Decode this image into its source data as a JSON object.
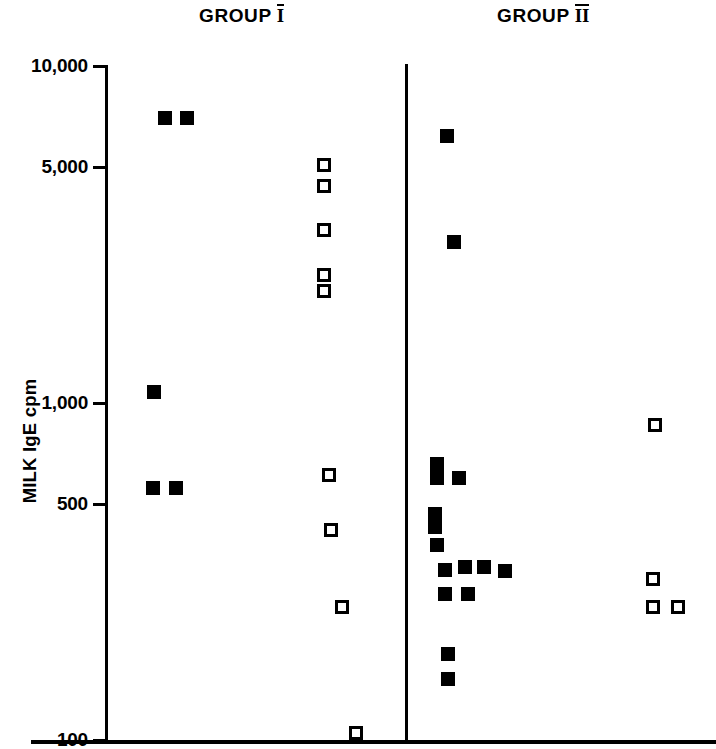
{
  "chart_data": {
    "type": "scatter",
    "title": "",
    "xlabel": "",
    "ylabel": "MILK IgE cpm",
    "yscale": "log",
    "ylim": [
      100,
      10000
    ],
    "ytick_labels": [
      "10,000",
      "5,000",
      "1,000",
      "500",
      "100"
    ],
    "ytick_values": [
      10000,
      5000,
      1000,
      500,
      100
    ],
    "grid": false,
    "legend": "none",
    "categories": [
      "GROUP I",
      "GROUP II"
    ],
    "series": [
      {
        "name": "filled-square",
        "marker": "filled square",
        "color": "#000000",
        "points": [
          {
            "group": "GROUP I",
            "x_px": 165,
            "value": 7000
          },
          {
            "group": "GROUP I",
            "x_px": 187,
            "value": 7000
          },
          {
            "group": "GROUP I",
            "x_px": 154,
            "value": 1080
          },
          {
            "group": "GROUP I",
            "x_px": 153,
            "value": 560
          },
          {
            "group": "GROUP I",
            "x_px": 176,
            "value": 560
          },
          {
            "group": "GROUP II",
            "x_px": 447,
            "value": 6200
          },
          {
            "group": "GROUP II",
            "x_px": 454,
            "value": 3000
          },
          {
            "group": "GROUP II",
            "x_px": 437,
            "value": 660
          },
          {
            "group": "GROUP II",
            "x_px": 437,
            "value": 600
          },
          {
            "group": "GROUP II",
            "x_px": 459,
            "value": 600
          },
          {
            "group": "GROUP II",
            "x_px": 435,
            "value": 470
          },
          {
            "group": "GROUP II",
            "x_px": 435,
            "value": 430
          },
          {
            "group": "GROUP II",
            "x_px": 437,
            "value": 380
          },
          {
            "group": "GROUP II",
            "x_px": 445,
            "value": 320
          },
          {
            "group": "GROUP II",
            "x_px": 465,
            "value": 325
          },
          {
            "group": "GROUP II",
            "x_px": 484,
            "value": 325
          },
          {
            "group": "GROUP II",
            "x_px": 505,
            "value": 318
          },
          {
            "group": "GROUP II",
            "x_px": 445,
            "value": 272
          },
          {
            "group": "GROUP II",
            "x_px": 468,
            "value": 272
          },
          {
            "group": "GROUP II",
            "x_px": 448,
            "value": 180
          },
          {
            "group": "GROUP II",
            "x_px": 448,
            "value": 152
          }
        ]
      },
      {
        "name": "open-square",
        "marker": "open square",
        "color": "#ffffff",
        "points": [
          {
            "group": "GROUP I",
            "x_px": 324,
            "value": 5100
          },
          {
            "group": "GROUP I",
            "x_px": 324,
            "value": 4400
          },
          {
            "group": "GROUP I",
            "x_px": 324,
            "value": 3250
          },
          {
            "group": "GROUP I",
            "x_px": 324,
            "value": 2400
          },
          {
            "group": "GROUP I",
            "x_px": 324,
            "value": 2150
          },
          {
            "group": "GROUP I",
            "x_px": 329,
            "value": 610
          },
          {
            "group": "GROUP I",
            "x_px": 331,
            "value": 420
          },
          {
            "group": "GROUP I",
            "x_px": 342,
            "value": 248
          },
          {
            "group": "GROUP I",
            "x_px": 356,
            "value": 105
          },
          {
            "group": "GROUP II",
            "x_px": 655,
            "value": 860
          },
          {
            "group": "GROUP II",
            "x_px": 653,
            "value": 300
          },
          {
            "group": "GROUP II",
            "x_px": 653,
            "value": 248
          },
          {
            "group": "GROUP II",
            "x_px": 678,
            "value": 248
          }
        ]
      }
    ]
  },
  "header": {
    "group1_label": "GROUP",
    "group1_numeral": "I",
    "group2_label": "GROUP",
    "group2_numeral": "II"
  },
  "axis": {
    "y_title": "MILK IgE cpm"
  }
}
